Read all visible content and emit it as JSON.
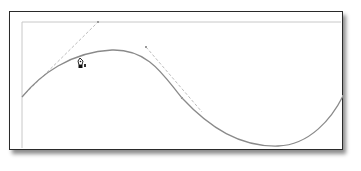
{
  "canvas": {
    "frame": {
      "x": 9,
      "y": 11,
      "width": 332,
      "height": 137,
      "border_color": "#2a2a2a"
    },
    "guides": {
      "color": "#c8c8c8",
      "horizontal": {
        "x1": 22,
        "y1": 22,
        "x2": 341,
        "y2": 22
      },
      "vertical": {
        "x1": 22,
        "y1": 22,
        "x2": 22,
        "y2": 148
      }
    },
    "curve": {
      "color": "#8a8a8a",
      "path": "M22,97 C40,75 70,52 112,50 C150,49 165,78 182,98 C210,128 240,147 278,146 C310,145 332,118 343,96"
    },
    "handles": [
      {
        "name": "start-handle",
        "x1": 22,
        "y1": 97,
        "x2": 98,
        "y2": 22,
        "color": "#bdbdbd"
      },
      {
        "name": "mid-handle",
        "x1": 146,
        "y1": 47,
        "x2": 202,
        "y2": 112,
        "color": "#bdbdbd"
      }
    ],
    "anchor_points": [
      {
        "x": 98,
        "y": 22
      },
      {
        "x": 146,
        "y": 47
      },
      {
        "x": 182,
        "y": 98
      },
      {
        "x": 343,
        "y": 96
      }
    ],
    "cursor": {
      "type": "pen-tool",
      "x": 80,
      "y": 58
    }
  }
}
